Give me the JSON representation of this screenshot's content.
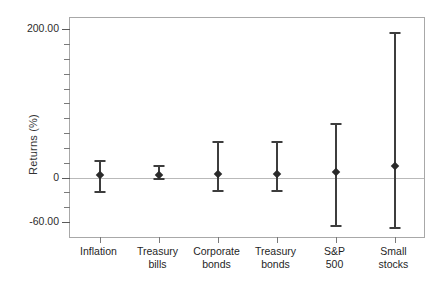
{
  "chart_data": {
    "type": "scatter",
    "title": "",
    "xlabel": "",
    "ylabel": "Returns (%)",
    "ylim": [
      -80,
      215
    ],
    "grid": false,
    "legend": null,
    "zero_line": 0,
    "y_major_ticks": [
      {
        "value": 200,
        "label": "200.00"
      },
      {
        "value": 0,
        "label": "0"
      },
      {
        "value": -60,
        "label": "-60.00"
      }
    ],
    "y_minor_ticks": [
      180,
      160,
      140,
      120,
      100,
      80,
      60,
      40,
      20,
      -20,
      -40
    ],
    "categories": [
      "Inflation",
      "Treasury\nbills",
      "Corporate\nbonds",
      "Treasury\nbonds",
      "S&P\n500",
      "Small\nstocks"
    ],
    "series": [
      {
        "name": "Mean return with range",
        "values": [
          3,
          4,
          5,
          5,
          8,
          15
        ],
        "low": [
          -20,
          -2,
          -18,
          -18,
          -65,
          -68
        ],
        "high": [
          23,
          15,
          48,
          48,
          72,
          195
        ]
      }
    ],
    "marker_color": "#2a2a2a",
    "errorbar_color": "#3d3d3d",
    "axis_color": "#a8a8a8",
    "zero_line_color": "#b9b9b9"
  }
}
